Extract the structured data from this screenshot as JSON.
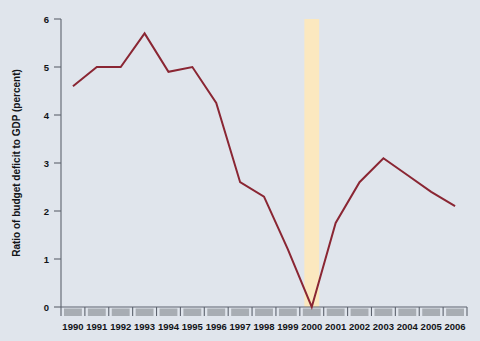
{
  "chart_data": {
    "type": "line",
    "title": "",
    "xlabel": "",
    "ylabel": "Ratio of budget deficit to GDP (percent)",
    "categories": [
      "1990",
      "1991",
      "1992",
      "1993",
      "1994",
      "1995",
      "1996",
      "1997",
      "1998",
      "1999",
      "2000",
      "2001",
      "2002",
      "2003",
      "2004",
      "2005",
      "2006"
    ],
    "x": [
      1990,
      1991,
      1992,
      1993,
      1994,
      1995,
      1996,
      1997,
      1998,
      1999,
      2000,
      2001,
      2002,
      2003,
      2004,
      2005,
      2006
    ],
    "values": [
      4.6,
      5.0,
      5.0,
      5.7,
      4.9,
      5.0,
      4.25,
      2.6,
      2.3,
      1.2,
      0.0,
      1.75,
      2.6,
      3.1,
      2.75,
      2.4,
      2.1
    ],
    "ylim": [
      0,
      6
    ],
    "yticks": [
      0,
      1,
      2,
      3,
      4,
      5,
      6
    ],
    "ytick_labels": [
      "0",
      "1",
      "2",
      "3",
      "4",
      "5",
      "6"
    ],
    "xlim": [
      1989.5,
      2006.5
    ],
    "grid": false,
    "legend": null,
    "legend_position": "none",
    "annotations": [
      {
        "type": "vertical-highlight-band",
        "name": "year-2000-highlight",
        "x_center": 2000,
        "y_from": 0,
        "y_to": 6,
        "color": "#fbe8bf"
      }
    ],
    "colors": {
      "line": "#8a2633",
      "background": "#e0e5ec",
      "axis": "#5d636e",
      "text": "#121418",
      "highlight_band": "#fbe8bf",
      "tick_block": "#a8adb3"
    }
  }
}
